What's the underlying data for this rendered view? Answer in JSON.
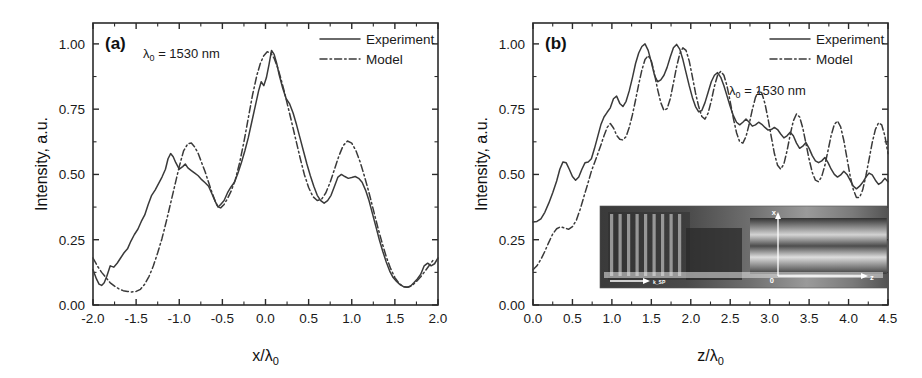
{
  "figure": {
    "background": "#ffffff",
    "line_color": "#3a3a3a",
    "axis_color": "#2b2b2b"
  },
  "chart_data": [
    {
      "type": "line",
      "panel_tag": "(a)",
      "title": "",
      "xlabel": "x/λ₀",
      "ylabel": "Intensity, a.u.",
      "annotation": "λ₀ = 1530 nm",
      "xlim": [
        -2.0,
        2.0
      ],
      "ylim": [
        0.0,
        1.08
      ],
      "xticks": [
        -2.0,
        -1.5,
        -1.0,
        -0.5,
        0.0,
        0.5,
        1.0,
        1.5,
        2.0
      ],
      "xticklabels": [
        "-2.0",
        "-1.5",
        "-1.0",
        "-0.5",
        "0.0",
        "0.5",
        "1.0",
        "1.5",
        "2.0"
      ],
      "yticks": [
        0.0,
        0.25,
        0.5,
        0.75,
        1.0
      ],
      "yticklabels": [
        "0.00",
        "0.25",
        "0.50",
        "0.75",
        "1.00"
      ],
      "grid": false,
      "legend_position": "top-right",
      "legend": [
        "Experiment",
        "Model"
      ],
      "series": [
        {
          "name": "Experiment",
          "style": "solid",
          "x": [
            -2.0,
            -1.96,
            -1.93,
            -1.9,
            -1.87,
            -1.84,
            -1.8,
            -1.76,
            -1.72,
            -1.68,
            -1.64,
            -1.6,
            -1.56,
            -1.52,
            -1.48,
            -1.44,
            -1.4,
            -1.36,
            -1.32,
            -1.28,
            -1.24,
            -1.2,
            -1.16,
            -1.13,
            -1.1,
            -1.07,
            -1.04,
            -1.0,
            -0.96,
            -0.93,
            -0.9,
            -0.86,
            -0.82,
            -0.78,
            -0.74,
            -0.7,
            -0.66,
            -0.62,
            -0.58,
            -0.55,
            -0.52,
            -0.48,
            -0.44,
            -0.4,
            -0.36,
            -0.32,
            -0.28,
            -0.24,
            -0.2,
            -0.16,
            -0.12,
            -0.08,
            -0.05,
            -0.02,
            0.01,
            0.04,
            0.07,
            0.1,
            0.13,
            0.16,
            0.2,
            0.24,
            0.28,
            0.32,
            0.36,
            0.4,
            0.44,
            0.48,
            0.52,
            0.56,
            0.6,
            0.64,
            0.68,
            0.72,
            0.76,
            0.8,
            0.84,
            0.88,
            0.92,
            0.96,
            1.0,
            1.04,
            1.08,
            1.12,
            1.16,
            1.2,
            1.24,
            1.28,
            1.32,
            1.36,
            1.4,
            1.44,
            1.48,
            1.52,
            1.56,
            1.6,
            1.64,
            1.68,
            1.72,
            1.76,
            1.8,
            1.84,
            1.88,
            1.92,
            1.96,
            2.0
          ],
          "y": [
            0.135,
            0.1,
            0.08,
            0.075,
            0.085,
            0.11,
            0.15,
            0.145,
            0.16,
            0.18,
            0.2,
            0.215,
            0.245,
            0.27,
            0.29,
            0.32,
            0.345,
            0.385,
            0.42,
            0.44,
            0.465,
            0.49,
            0.52,
            0.56,
            0.58,
            0.568,
            0.545,
            0.52,
            0.53,
            0.54,
            0.525,
            0.515,
            0.505,
            0.495,
            0.48,
            0.468,
            0.455,
            0.425,
            0.395,
            0.375,
            0.385,
            0.4,
            0.43,
            0.452,
            0.47,
            0.505,
            0.545,
            0.59,
            0.64,
            0.7,
            0.76,
            0.82,
            0.855,
            0.84,
            0.87,
            0.92,
            0.975,
            0.96,
            0.925,
            0.88,
            0.83,
            0.79,
            0.77,
            0.735,
            0.69,
            0.64,
            0.59,
            0.54,
            0.495,
            0.455,
            0.42,
            0.4,
            0.39,
            0.4,
            0.42,
            0.455,
            0.49,
            0.5,
            0.492,
            0.485,
            0.488,
            0.492,
            0.485,
            0.47,
            0.44,
            0.4,
            0.35,
            0.3,
            0.25,
            0.205,
            0.165,
            0.13,
            0.105,
            0.09,
            0.078,
            0.07,
            0.068,
            0.072,
            0.085,
            0.1,
            0.118,
            0.15,
            0.16,
            0.15,
            0.158,
            0.18,
            0.215
          ]
        },
        {
          "name": "Model",
          "style": "dashdot",
          "x": [
            -2.0,
            -1.95,
            -1.9,
            -1.85,
            -1.8,
            -1.75,
            -1.7,
            -1.65,
            -1.6,
            -1.55,
            -1.5,
            -1.45,
            -1.4,
            -1.35,
            -1.3,
            -1.25,
            -1.2,
            -1.15,
            -1.1,
            -1.05,
            -1.0,
            -0.95,
            -0.9,
            -0.86,
            -0.82,
            -0.78,
            -0.74,
            -0.7,
            -0.66,
            -0.62,
            -0.58,
            -0.55,
            -0.52,
            -0.48,
            -0.44,
            -0.4,
            -0.35,
            -0.3,
            -0.25,
            -0.2,
            -0.15,
            -0.1,
            -0.06,
            -0.02,
            0.02,
            0.06,
            0.1,
            0.14,
            0.18,
            0.22,
            0.26,
            0.3,
            0.35,
            0.4,
            0.45,
            0.5,
            0.55,
            0.6,
            0.65,
            0.7,
            0.75,
            0.8,
            0.85,
            0.9,
            0.95,
            1.0,
            1.05,
            1.1,
            1.15,
            1.2,
            1.25,
            1.3,
            1.35,
            1.4,
            1.45,
            1.5,
            1.55,
            1.6,
            1.65,
            1.7,
            1.75,
            1.8,
            1.85,
            1.9,
            1.95,
            2.0
          ],
          "y": [
            0.18,
            0.15,
            0.125,
            0.105,
            0.085,
            0.072,
            0.062,
            0.055,
            0.052,
            0.05,
            0.052,
            0.06,
            0.08,
            0.11,
            0.15,
            0.2,
            0.255,
            0.32,
            0.39,
            0.46,
            0.53,
            0.59,
            0.618,
            0.62,
            0.605,
            0.58,
            0.545,
            0.51,
            0.47,
            0.43,
            0.395,
            0.375,
            0.372,
            0.385,
            0.408,
            0.435,
            0.48,
            0.545,
            0.625,
            0.715,
            0.805,
            0.88,
            0.925,
            0.955,
            0.97,
            0.965,
            0.945,
            0.91,
            0.865,
            0.815,
            0.76,
            0.705,
            0.635,
            0.565,
            0.5,
            0.45,
            0.415,
            0.4,
            0.405,
            0.43,
            0.47,
            0.52,
            0.57,
            0.61,
            0.628,
            0.62,
            0.59,
            0.545,
            0.49,
            0.43,
            0.365,
            0.3,
            0.24,
            0.185,
            0.14,
            0.105,
            0.082,
            0.07,
            0.068,
            0.075,
            0.09,
            0.108,
            0.13,
            0.152,
            0.175
          ]
        }
      ]
    },
    {
      "type": "line",
      "panel_tag": "(b)",
      "title": "",
      "xlabel": "z/λ₀",
      "ylabel": "Intensity, a.u.",
      "annotation": "λ₀ = 1530 nm",
      "xlim": [
        0.0,
        4.5
      ],
      "ylim": [
        0.0,
        1.08
      ],
      "xticks": [
        0.0,
        0.5,
        1.0,
        1.5,
        2.0,
        2.5,
        3.0,
        3.5,
        4.0,
        4.5
      ],
      "xticklabels": [
        "0.0",
        "0.5",
        "1.0",
        "1.5",
        "2.0",
        "2.5",
        "3.0",
        "3.5",
        "4.0",
        "4.5"
      ],
      "yticks": [
        0.0,
        0.25,
        0.5,
        0.75,
        1.0
      ],
      "yticklabels": [
        "0.00",
        "0.25",
        "0.50",
        "0.75",
        "1.00"
      ],
      "grid": false,
      "legend_position": "top-right",
      "legend": [
        "Experiment",
        "Model"
      ],
      "inset": {
        "description": "near-field micrograph of waveguide with surface plasmon beam",
        "labels": [
          "x",
          "0",
          "z",
          "k_SP"
        ]
      },
      "series": [
        {
          "name": "Experiment",
          "style": "solid",
          "x": [
            0.0,
            0.05,
            0.1,
            0.15,
            0.2,
            0.25,
            0.3,
            0.34,
            0.38,
            0.42,
            0.46,
            0.5,
            0.54,
            0.58,
            0.62,
            0.66,
            0.7,
            0.74,
            0.78,
            0.82,
            0.86,
            0.9,
            0.94,
            0.98,
            1.02,
            1.06,
            1.1,
            1.14,
            1.18,
            1.22,
            1.26,
            1.3,
            1.34,
            1.38,
            1.42,
            1.46,
            1.5,
            1.54,
            1.58,
            1.62,
            1.66,
            1.7,
            1.74,
            1.78,
            1.82,
            1.86,
            1.9,
            1.94,
            1.98,
            2.02,
            2.06,
            2.1,
            2.14,
            2.18,
            2.22,
            2.26,
            2.3,
            2.34,
            2.38,
            2.42,
            2.46,
            2.5,
            2.54,
            2.58,
            2.62,
            2.66,
            2.7,
            2.74,
            2.78,
            2.82,
            2.86,
            2.9,
            2.94,
            2.98,
            3.02,
            3.06,
            3.1,
            3.14,
            3.18,
            3.22,
            3.26,
            3.3,
            3.34,
            3.38,
            3.42,
            3.46,
            3.5,
            3.54,
            3.58,
            3.62,
            3.66,
            3.7,
            3.74,
            3.78,
            3.82,
            3.86,
            3.9,
            3.94,
            3.98,
            4.02,
            4.06,
            4.1,
            4.14,
            4.18,
            4.22,
            4.26,
            4.3,
            4.34,
            4.38,
            4.42,
            4.46,
            4.5
          ],
          "y": [
            0.318,
            0.32,
            0.33,
            0.355,
            0.39,
            0.43,
            0.475,
            0.52,
            0.548,
            0.545,
            0.52,
            0.492,
            0.478,
            0.49,
            0.52,
            0.545,
            0.548,
            0.56,
            0.6,
            0.645,
            0.69,
            0.72,
            0.738,
            0.755,
            0.79,
            0.8,
            0.772,
            0.76,
            0.78,
            0.82,
            0.87,
            0.925,
            0.965,
            0.99,
            1.0,
            0.975,
            0.93,
            0.88,
            0.855,
            0.862,
            0.88,
            0.91,
            0.95,
            0.985,
            0.998,
            0.98,
            0.94,
            0.89,
            0.84,
            0.795,
            0.76,
            0.74,
            0.745,
            0.775,
            0.815,
            0.855,
            0.88,
            0.89,
            0.872,
            0.84,
            0.8,
            0.76,
            0.725,
            0.7,
            0.69,
            0.7,
            0.712,
            0.7,
            0.685,
            0.69,
            0.7,
            0.692,
            0.68,
            0.67,
            0.672,
            0.68,
            0.672,
            0.655,
            0.64,
            0.648,
            0.662,
            0.648,
            0.62,
            0.6,
            0.608,
            0.622,
            0.6,
            0.572,
            0.552,
            0.545,
            0.552,
            0.565,
            0.545,
            0.52,
            0.5,
            0.49,
            0.498,
            0.512,
            0.5,
            0.478,
            0.455,
            0.445,
            0.455,
            0.47,
            0.49,
            0.505,
            0.498,
            0.478,
            0.462,
            0.47,
            0.485,
            0.472
          ]
        },
        {
          "name": "Model",
          "style": "dashdot",
          "x": [
            0.0,
            0.05,
            0.1,
            0.15,
            0.2,
            0.25,
            0.3,
            0.35,
            0.4,
            0.45,
            0.5,
            0.55,
            0.6,
            0.65,
            0.7,
            0.74,
            0.78,
            0.82,
            0.86,
            0.9,
            0.94,
            0.98,
            1.02,
            1.06,
            1.1,
            1.14,
            1.18,
            1.22,
            1.26,
            1.3,
            1.34,
            1.38,
            1.42,
            1.46,
            1.5,
            1.54,
            1.58,
            1.62,
            1.66,
            1.7,
            1.74,
            1.78,
            1.82,
            1.86,
            1.9,
            1.94,
            1.98,
            2.02,
            2.06,
            2.1,
            2.14,
            2.18,
            2.22,
            2.26,
            2.3,
            2.34,
            2.38,
            2.42,
            2.46,
            2.5,
            2.54,
            2.58,
            2.62,
            2.66,
            2.7,
            2.74,
            2.78,
            2.82,
            2.86,
            2.9,
            2.94,
            2.98,
            3.02,
            3.06,
            3.1,
            3.14,
            3.18,
            3.22,
            3.26,
            3.3,
            3.34,
            3.38,
            3.42,
            3.46,
            3.5,
            3.54,
            3.58,
            3.62,
            3.66,
            3.7,
            3.74,
            3.78,
            3.82,
            3.86,
            3.9,
            3.94,
            3.98,
            4.02,
            4.06,
            4.1,
            4.14,
            4.18,
            4.22,
            4.26,
            4.3,
            4.34,
            4.38,
            4.42,
            4.46,
            4.5
          ],
          "y": [
            0.135,
            0.15,
            0.175,
            0.205,
            0.24,
            0.272,
            0.292,
            0.3,
            0.295,
            0.29,
            0.3,
            0.325,
            0.368,
            0.42,
            0.47,
            0.512,
            0.545,
            0.578,
            0.612,
            0.648,
            0.68,
            0.695,
            0.678,
            0.65,
            0.635,
            0.632,
            0.645,
            0.68,
            0.728,
            0.785,
            0.845,
            0.9,
            0.94,
            0.955,
            0.935,
            0.885,
            0.825,
            0.775,
            0.745,
            0.752,
            0.79,
            0.85,
            0.912,
            0.962,
            0.985,
            0.975,
            0.935,
            0.875,
            0.812,
            0.76,
            0.722,
            0.712,
            0.735,
            0.782,
            0.838,
            0.88,
            0.895,
            0.88,
            0.838,
            0.778,
            0.715,
            0.66,
            0.625,
            0.62,
            0.645,
            0.692,
            0.748,
            0.795,
            0.82,
            0.812,
            0.772,
            0.712,
            0.645,
            0.58,
            0.535,
            0.52,
            0.54,
            0.59,
            0.652,
            0.705,
            0.732,
            0.72,
            0.678,
            0.618,
            0.558,
            0.508,
            0.478,
            0.472,
            0.492,
            0.535,
            0.592,
            0.65,
            0.692,
            0.705,
            0.682,
            0.63,
            0.562,
            0.495,
            0.442,
            0.412,
            0.412,
            0.442,
            0.495,
            0.558,
            0.622,
            0.672,
            0.698,
            0.69,
            0.648,
            0.58
          ]
        }
      ]
    }
  ]
}
